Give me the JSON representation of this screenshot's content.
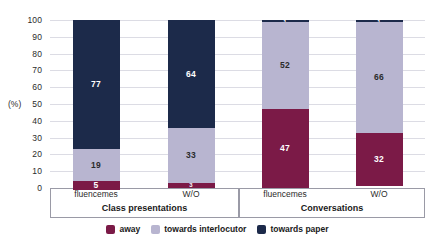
{
  "chart_data": {
    "type": "bar",
    "title": "",
    "subtitle": "",
    "xlabel": "",
    "ylabel": "(%)",
    "ylim": [
      0,
      100
    ],
    "ytick_labels": [
      "100",
      "90",
      "80",
      "70",
      "60",
      "50",
      "40",
      "30",
      "20",
      "10",
      "0"
    ],
    "ytick_values": [
      100,
      90,
      80,
      70,
      60,
      50,
      40,
      30,
      20,
      10,
      0
    ],
    "grid": true,
    "stacked": true,
    "legend_position": "bottom",
    "groups": [
      {
        "label": "Class presentations",
        "categories": [
          "fluencemes",
          "W/O"
        ]
      },
      {
        "label": "Conversations",
        "categories": [
          "fluencemes",
          "W/O"
        ]
      }
    ],
    "categories": [
      "fluencemes",
      "W/O",
      "fluencemes",
      "W/O"
    ],
    "series": [
      {
        "name": "away",
        "color": "#7b1a47",
        "values": [
          5,
          3,
          47,
          32
        ]
      },
      {
        "name": "towards interlocutor",
        "color": "#b8b5d0",
        "values": [
          19,
          33,
          52,
          66
        ]
      },
      {
        "name": "towards paper",
        "color": "#1c2a4a",
        "values": [
          77,
          64,
          1,
          1
        ]
      }
    ],
    "bars": [
      {
        "group": "Class presentations",
        "category": "fluencemes",
        "segments": [
          {
            "name": "away",
            "value": 5,
            "label": "5",
            "color": "#7b1a47"
          },
          {
            "name": "towards interlocutor",
            "value": 19,
            "label": "19",
            "color": "#b8b5d0"
          },
          {
            "name": "towards paper",
            "value": 77,
            "label": "77",
            "color": "#1c2a4a"
          }
        ]
      },
      {
        "group": "Class presentations",
        "category": "W/O",
        "segments": [
          {
            "name": "away",
            "value": 3,
            "label": "3",
            "color": "#7b1a47"
          },
          {
            "name": "towards interlocutor",
            "value": 33,
            "label": "33",
            "color": "#b8b5d0"
          },
          {
            "name": "towards paper",
            "value": 64,
            "label": "64",
            "color": "#1c2a4a"
          }
        ]
      },
      {
        "group": "Conversations",
        "category": "fluencemes",
        "segments": [
          {
            "name": "away",
            "value": 47,
            "label": "47",
            "color": "#7b1a47"
          },
          {
            "name": "towards interlocutor",
            "value": 52,
            "label": "52",
            "color": "#b8b5d0"
          },
          {
            "name": "towards paper",
            "value": 1,
            "label": "1",
            "color": "#1c2a4a"
          }
        ]
      },
      {
        "group": "Conversations",
        "category": "W/O",
        "segments": [
          {
            "name": "away",
            "value": 32,
            "label": "32",
            "color": "#7b1a47"
          },
          {
            "name": "towards interlocutor",
            "value": 66,
            "label": "66",
            "color": "#b8b5d0"
          },
          {
            "name": "towards paper",
            "value": 1,
            "label": "1",
            "color": "#1c2a4a"
          }
        ]
      }
    ],
    "legend": [
      {
        "label": "away",
        "color": "#7b1a47"
      },
      {
        "label": "towards interlocutor",
        "color": "#b8b5d0"
      },
      {
        "label": "towards paper",
        "color": "#1c2a4a"
      }
    ]
  }
}
